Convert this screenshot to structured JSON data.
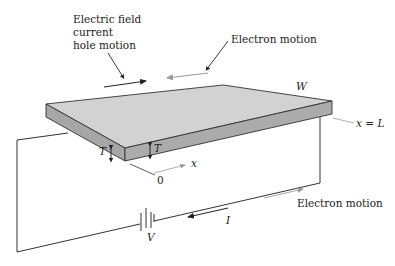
{
  "diagram": {
    "labels": {
      "field_line1": "Electric field",
      "field_line2": "current",
      "field_line3": "hole motion",
      "electron_motion_top": "Electron motion",
      "electron_motion_bottom": "Electron motion",
      "width": "W",
      "thickness_left": "T",
      "thickness_right": "T",
      "x_axis": "x",
      "origin": "0",
      "x_end": "x = L",
      "voltage": "V",
      "current": "I"
    },
    "colors": {
      "slab_top": "#d2d2d2",
      "slab_side": "#a8a8a8",
      "line": "#333333",
      "gray_arrow": "#999999"
    }
  }
}
